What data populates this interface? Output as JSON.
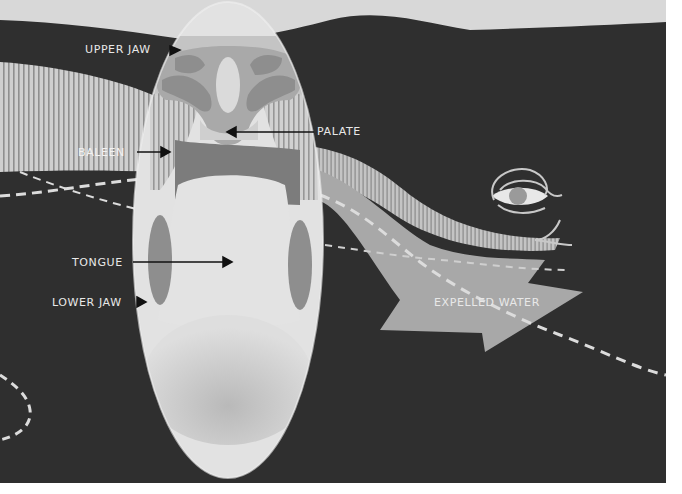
{
  "figure": {
    "labels": {
      "upper_jaw": "UPPER JAW",
      "palate": "PALATE",
      "baleen": "BALEEN",
      "tongue": "TONGUE",
      "lower_jaw": "LOWER JAW",
      "expelled_water": "EXPELLED WATER"
    },
    "colors": {
      "background_sky": "#d6d6d6",
      "whale_body": "#2e2e2e",
      "cross_section_oval": "#dcdcdc",
      "baleen_band": "#c8c8c8",
      "arrow_water": "#a9a9a9",
      "tongue": "#e4e4e4",
      "label_text": "#e8e8e8",
      "pointer_arrows": "#111111"
    }
  }
}
